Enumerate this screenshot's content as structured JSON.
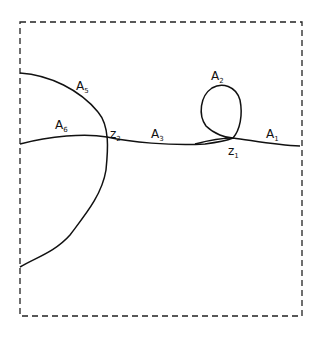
{
  "diagram": {
    "type": "hand-drawn curve diagram",
    "frame": {
      "style": "dashed",
      "x": 20,
      "y": 22,
      "width": 282,
      "height": 294
    },
    "labels": {
      "A1": {
        "base": "A",
        "sub": "1"
      },
      "A2": {
        "base": "A",
        "sub": "2"
      },
      "A3": {
        "base": "A",
        "sub": "3"
      },
      "A4": {
        "base": "A",
        "sub": "4"
      },
      "A5": {
        "base": "A",
        "sub": "5"
      },
      "A6": {
        "base": "A",
        "sub": "6"
      },
      "z1": {
        "base": "z",
        "sub": "1"
      },
      "z2": {
        "base": "z",
        "sub": "2"
      }
    },
    "stroke_color": "#111111",
    "background": "#ffffff"
  }
}
